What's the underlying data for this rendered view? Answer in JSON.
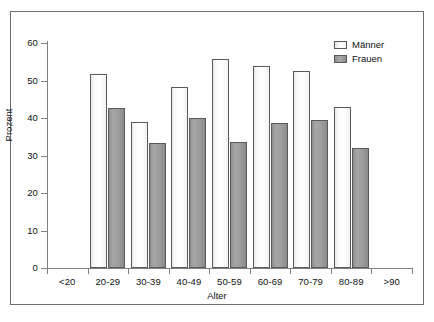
{
  "chart_data": {
    "type": "bar",
    "title": "",
    "xlabel": "Alter",
    "ylabel": "Prozent",
    "categories": [
      "<20",
      "20-29",
      "30-39",
      "40-49",
      "50-59",
      "60-69",
      "70-79",
      "80-89",
      ">90"
    ],
    "series": [
      {
        "name": "Männer",
        "color": "#ffffff",
        "values": [
          null,
          51.7,
          38.9,
          48.3,
          55.7,
          53.9,
          52.5,
          42.9,
          null
        ]
      },
      {
        "name": "Frauen",
        "color": "#9c9c9c",
        "values": [
          null,
          42.7,
          33.3,
          40.0,
          33.6,
          38.7,
          39.4,
          32.0,
          null
        ]
      }
    ],
    "ylim": [
      0,
      60
    ],
    "y_ticks": [
      0,
      10,
      20,
      30,
      40,
      50,
      60
    ],
    "y_tick_labels": [
      "0",
      "10",
      "20",
      "30",
      "40",
      "50",
      "60"
    ],
    "grid": false,
    "legend_position": "top-right",
    "legend_entries": [
      "Männer",
      "Frauen"
    ]
  },
  "axes": {
    "y_title": "Prozent",
    "x_title": "Alter"
  },
  "legend": {
    "items": [
      {
        "label": "Männer",
        "swatch": "legend-swatch-maenner"
      },
      {
        "label": "Frauen",
        "swatch": "legend-swatch-frauen"
      }
    ]
  },
  "colors": {
    "bar_maenner": "#ffffff",
    "bar_frauen": "#9c9c9c",
    "bar_outline": "#5a5a5a",
    "axis": "#808080",
    "frame": "#6e6e6e",
    "text": "#111111",
    "background": "#ffffff"
  }
}
